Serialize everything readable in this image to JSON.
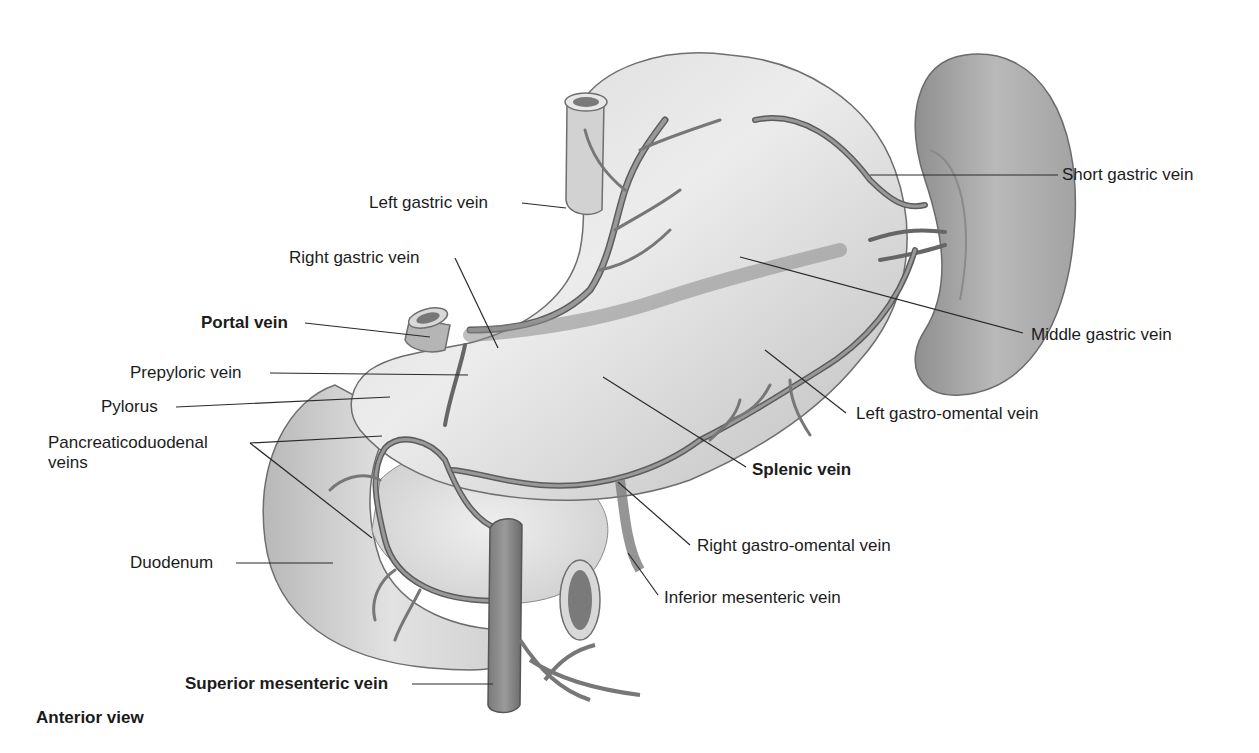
{
  "figure": {
    "type": "anatomical-illustration",
    "view_label": "Anterior view",
    "colors": {
      "background": "#ffffff",
      "organ_fill": "#c9c9c9",
      "organ_light": "#e6e6e6",
      "organ_stroke": "#6e6e6e",
      "vein_fill": "#8c8c8c",
      "vein_stroke": "#555555",
      "spleen_fill": "#a8a8a8",
      "leader_line": "#2a2a2a",
      "text": "#1c1c1c"
    }
  },
  "labels": [
    {
      "id": "left-gastric-vein",
      "text": "Left gastric vein",
      "bold": false,
      "side": "left"
    },
    {
      "id": "right-gastric-vein",
      "text": "Right gastric vein",
      "bold": false,
      "side": "left"
    },
    {
      "id": "portal-vein",
      "text": "Portal vein",
      "bold": true,
      "side": "left"
    },
    {
      "id": "prepyloric-vein",
      "text": "Prepyloric vein",
      "bold": false,
      "side": "left"
    },
    {
      "id": "pylorus",
      "text": "Pylorus",
      "bold": false,
      "side": "left"
    },
    {
      "id": "pancreaticoduodenal-veins-1",
      "text": "Pancreaticoduodenal",
      "bold": false,
      "side": "left"
    },
    {
      "id": "pancreaticoduodenal-veins-2",
      "text": "veins",
      "bold": false,
      "side": "left"
    },
    {
      "id": "duodenum",
      "text": "Duodenum",
      "bold": false,
      "side": "left"
    },
    {
      "id": "superior-mesenteric-vein",
      "text": "Superior mesenteric vein",
      "bold": true,
      "side": "left"
    },
    {
      "id": "short-gastric-vein",
      "text": "Short gastric vein",
      "bold": false,
      "side": "right"
    },
    {
      "id": "middle-gastric-vein",
      "text": "Middle gastric vein",
      "bold": false,
      "side": "right"
    },
    {
      "id": "left-gastro-omental-vein",
      "text": "Left gastro-omental vein",
      "bold": false,
      "side": "right"
    },
    {
      "id": "splenic-vein",
      "text": "Splenic vein",
      "bold": true,
      "side": "right"
    },
    {
      "id": "right-gastro-omental-vein",
      "text": "Right gastro-omental vein",
      "bold": false,
      "side": "right"
    },
    {
      "id": "inferior-mesenteric-vein",
      "text": "Inferior mesenteric vein",
      "bold": false,
      "side": "right"
    }
  ]
}
